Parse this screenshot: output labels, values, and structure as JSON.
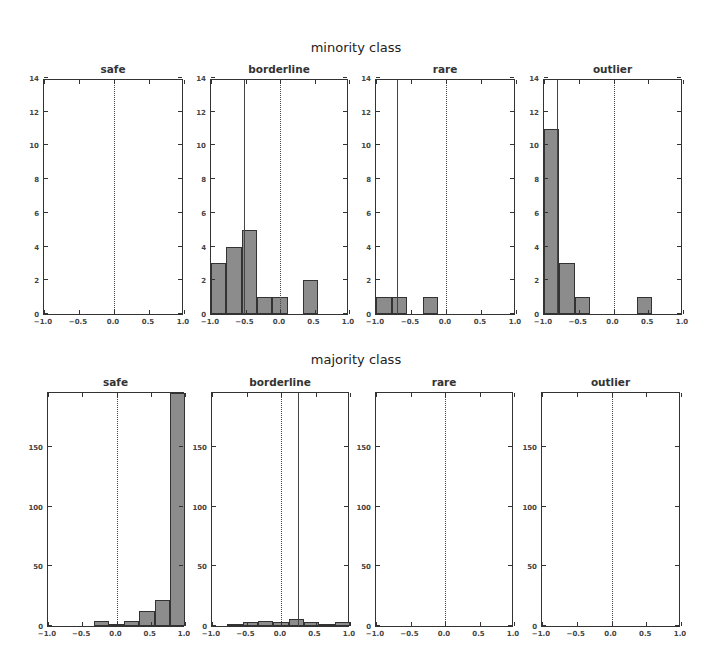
{
  "figure": {
    "row_titles": [
      "minority class",
      "majority class"
    ]
  },
  "chart_data": [
    {
      "type": "bar",
      "title": "safe",
      "row": "minority class",
      "bin_edges": [
        -1.0,
        -0.778,
        -0.556,
        -0.333,
        -0.111,
        0.111,
        0.333,
        0.556,
        0.778,
        1.0
      ],
      "values": [],
      "xlim": [
        -1.0,
        1.0
      ],
      "ylim": [
        0,
        14
      ],
      "xticks": [
        "-1.0",
        "-0.5",
        "0.0",
        "0.5",
        "1.0"
      ],
      "yticks": [
        "0",
        "2",
        "4",
        "6",
        "8",
        "10",
        "12",
        "14"
      ],
      "zero_line": 0.0,
      "mean_line": null
    },
    {
      "type": "bar",
      "title": "borderline",
      "row": "minority class",
      "bin_edges": [
        -1.0,
        -0.778,
        -0.556,
        -0.333,
        -0.111,
        0.111,
        0.333,
        0.556,
        0.778,
        1.0
      ],
      "values": [
        3,
        4,
        5,
        1,
        1,
        0,
        2,
        0,
        0
      ],
      "xlim": [
        -1.0,
        1.0
      ],
      "ylim": [
        0,
        14
      ],
      "xticks": [
        "-1.0",
        "-0.5",
        "0.0",
        "0.5",
        "1.0"
      ],
      "yticks": [
        "0",
        "2",
        "4",
        "6",
        "8",
        "10",
        "12",
        "14"
      ],
      "zero_line": 0.0,
      "mean_line": -0.52
    },
    {
      "type": "bar",
      "title": "rare",
      "row": "minority class",
      "bin_edges": [
        -1.0,
        -0.778,
        -0.556,
        -0.333,
        -0.111,
        0.111
      ],
      "values": [
        1,
        1,
        0,
        1,
        0
      ],
      "xlim": [
        -1.0,
        1.0
      ],
      "ylim": [
        0,
        14
      ],
      "xticks": [
        "-1.0",
        "-0.5",
        "0.0",
        "0.5",
        "1.0"
      ],
      "yticks": [
        "0",
        "2",
        "4",
        "6",
        "8",
        "10",
        "12",
        "14"
      ],
      "zero_line": 0.0,
      "mean_line": -0.7
    },
    {
      "type": "bar",
      "title": "outlier",
      "row": "minority class",
      "bin_edges": [
        -1.0,
        -0.778,
        -0.556,
        -0.333,
        -0.111,
        0.111,
        0.333,
        0.556
      ],
      "values": [
        11,
        3,
        1,
        0,
        0,
        0,
        1
      ],
      "xlim": [
        -1.0,
        1.0
      ],
      "ylim": [
        0,
        14
      ],
      "xticks": [
        "-1.0",
        "-0.5",
        "0.0",
        "0.5",
        "1.0"
      ],
      "yticks": [
        "0",
        "2",
        "4",
        "6",
        "8",
        "10",
        "12",
        "14"
      ],
      "zero_line": 0.0,
      "mean_line": -0.82
    },
    {
      "type": "bar",
      "title": "safe",
      "row": "majority class",
      "bin_edges": [
        -1.0,
        -0.778,
        -0.556,
        -0.333,
        -0.111,
        0.111,
        0.333,
        0.556,
        0.778,
        1.0
      ],
      "values": [
        0,
        0,
        0,
        4,
        2,
        4,
        13,
        22,
        195
      ],
      "xlim": [
        -1.0,
        1.0
      ],
      "ylim": [
        0,
        197
      ],
      "xticks": [
        "-1.0",
        "-0.5",
        "0.0",
        "0.5",
        "1.0"
      ],
      "yticks": [
        "0",
        "50",
        "100",
        "150"
      ],
      "zero_line": 0.0,
      "mean_line": null
    },
    {
      "type": "bar",
      "title": "borderline",
      "row": "majority class",
      "bin_edges": [
        -1.0,
        -0.778,
        -0.556,
        -0.333,
        -0.111,
        0.111,
        0.333,
        0.556,
        0.778,
        1.0
      ],
      "values": [
        0,
        1,
        3,
        4,
        3,
        6,
        3,
        2,
        3
      ],
      "xlim": [
        -1.0,
        1.0
      ],
      "ylim": [
        0,
        197
      ],
      "xticks": [
        "-1.0",
        "-0.5",
        "0.0",
        "0.5",
        "1.0"
      ],
      "yticks": [
        "0",
        "50",
        "100",
        "150"
      ],
      "zero_line": 0.0,
      "mean_line": 0.25
    },
    {
      "type": "bar",
      "title": "rare",
      "row": "majority class",
      "bin_edges": [],
      "values": [],
      "xlim": [
        -1.0,
        1.0
      ],
      "ylim": [
        0,
        197
      ],
      "xticks": [
        "-1.0",
        "-0.5",
        "0.0",
        "0.5",
        "1.0"
      ],
      "yticks": [
        "0",
        "50",
        "100",
        "150"
      ],
      "zero_line": 0.0,
      "mean_line": null
    },
    {
      "type": "bar",
      "title": "outlier",
      "row": "majority class",
      "bin_edges": [],
      "values": [],
      "xlim": [
        -1.0,
        1.0
      ],
      "ylim": [
        0,
        197
      ],
      "xticks": [
        "-1.0",
        "-0.5",
        "0.0",
        "0.5",
        "1.0"
      ],
      "yticks": [
        "0",
        "50",
        "100",
        "150"
      ],
      "zero_line": 0.0,
      "mean_line": null
    }
  ]
}
